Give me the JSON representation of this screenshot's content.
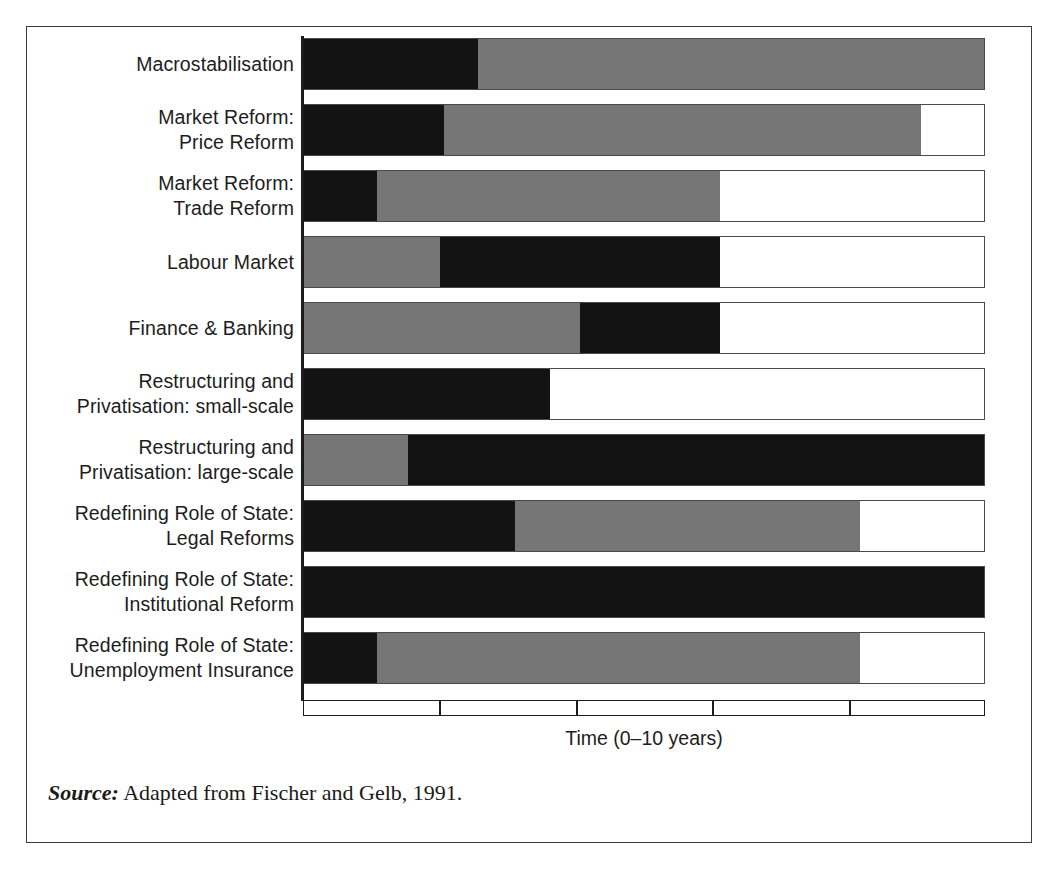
{
  "figure": {
    "x_axis_title": "Time (0–10 years)",
    "source_label": "Source:",
    "source_text": " Adapted from Fischer and Gelb, 1991."
  },
  "colors": {
    "black": "#131313",
    "gray": "#767676",
    "white": "#ffffff",
    "outline": "#4a4a4a",
    "axis": "#1c1c1c",
    "frame": "#3b3b3b",
    "text": "#1d1d1d"
  },
  "chart_data": {
    "type": "bar",
    "title": "",
    "xlabel": "Time (0–10 years)",
    "ylabel": "",
    "xlim": [
      0,
      10
    ],
    "xticks": [
      0,
      2,
      4,
      6,
      8,
      10
    ],
    "grid": false,
    "legend": [],
    "orientation": "horizontal",
    "stacked": true,
    "note": "Each row is a reform area; segments are phases measured in years along a 0-10 year timeline. 'black' = intensive reform period, 'gray' = continuing/secondary period, 'white' = no activity / remainder of timeline.",
    "categories": [
      "Macrostabilisation",
      "Market Reform: Price Reform",
      "Market Reform: Trade Reform",
      "Labour Market",
      "Finance & Banking",
      "Restructuring and Privatisation: small-scale",
      "Restructuring and Privatisation: large-scale",
      "Redefining Role of State: Legal Reforms",
      "Redefining Role of State: Institutional Reform",
      "Redefining Role of State: Unemployment Insurance"
    ],
    "rows": [
      {
        "label_lines": [
          "Macrostabilisation"
        ],
        "segments": [
          {
            "shade": "black",
            "start": 0.0,
            "end": 2.55
          },
          {
            "shade": "gray",
            "start": 2.55,
            "end": 10.0
          }
        ]
      },
      {
        "label_lines": [
          "Market Reform:",
          "Price Reform"
        ],
        "segments": [
          {
            "shade": "black",
            "start": 0.0,
            "end": 2.05
          },
          {
            "shade": "gray",
            "start": 2.05,
            "end": 9.05
          },
          {
            "shade": "white",
            "start": 9.05,
            "end": 10.0
          }
        ]
      },
      {
        "label_lines": [
          "Market Reform:",
          "Trade Reform"
        ],
        "segments": [
          {
            "shade": "black",
            "start": 0.0,
            "end": 1.07
          },
          {
            "shade": "gray",
            "start": 1.07,
            "end": 6.1
          },
          {
            "shade": "white",
            "start": 6.1,
            "end": 10.0
          }
        ]
      },
      {
        "label_lines": [
          "Labour Market"
        ],
        "segments": [
          {
            "shade": "gray",
            "start": 0.0,
            "end": 2.0
          },
          {
            "shade": "black",
            "start": 2.0,
            "end": 6.1
          },
          {
            "shade": "white",
            "start": 6.1,
            "end": 10.0
          }
        ]
      },
      {
        "label_lines": [
          "Finance & Banking"
        ],
        "segments": [
          {
            "shade": "gray",
            "start": 0.0,
            "end": 4.05
          },
          {
            "shade": "black",
            "start": 4.05,
            "end": 6.1
          },
          {
            "shade": "white",
            "start": 6.1,
            "end": 10.0
          }
        ]
      },
      {
        "label_lines": [
          "Restructuring and",
          "Privatisation: small-scale"
        ],
        "segments": [
          {
            "shade": "black",
            "start": 0.0,
            "end": 3.6
          },
          {
            "shade": "white",
            "start": 3.6,
            "end": 10.0
          }
        ]
      },
      {
        "label_lines": [
          "Restructuring and",
          "Privatisation: large-scale"
        ],
        "segments": [
          {
            "shade": "gray",
            "start": 0.0,
            "end": 1.53
          },
          {
            "shade": "black",
            "start": 1.53,
            "end": 10.0
          }
        ]
      },
      {
        "label_lines": [
          "Redefining Role of State:",
          "Legal Reforms"
        ],
        "segments": [
          {
            "shade": "black",
            "start": 0.0,
            "end": 3.1
          },
          {
            "shade": "gray",
            "start": 3.1,
            "end": 8.15
          },
          {
            "shade": "white",
            "start": 8.15,
            "end": 10.0
          }
        ]
      },
      {
        "label_lines": [
          "Redefining Role of State:",
          "Institutional Reform"
        ],
        "segments": [
          {
            "shade": "black",
            "start": 0.0,
            "end": 10.0
          }
        ]
      },
      {
        "label_lines": [
          "Redefining Role of State:",
          "Unemployment Insurance"
        ],
        "segments": [
          {
            "shade": "black",
            "start": 0.0,
            "end": 1.07
          },
          {
            "shade": "gray",
            "start": 1.07,
            "end": 8.15
          },
          {
            "shade": "white",
            "start": 8.15,
            "end": 10.0
          }
        ]
      }
    ]
  }
}
